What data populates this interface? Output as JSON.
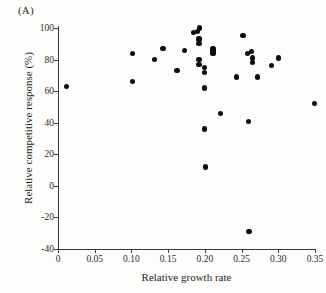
{
  "figure": {
    "panel_label": "(A)"
  },
  "chart_data": {
    "type": "scatter",
    "title": "(A)",
    "xlabel": "Relative growth rate",
    "ylabel": "Relative competitive response (%)",
    "xlim": [
      0,
      0.35
    ],
    "ylim": [
      -40,
      100
    ],
    "grid": false,
    "legend": null,
    "xticks": [
      "0",
      "0.05",
      "0.10",
      "0.15",
      "0.20",
      "0.25",
      "0.30",
      "0.35"
    ],
    "xtick_values": [
      0,
      0.05,
      0.1,
      0.15,
      0.2,
      0.25,
      0.3,
      0.35
    ],
    "yticks": [
      "100",
      "80",
      "60",
      "40",
      "20",
      "0",
      "-20",
      "-40"
    ],
    "ytick_values": [
      100,
      80,
      60,
      40,
      20,
      0,
      -20,
      -40
    ],
    "marker": "filled-circle",
    "marker_color": "#0c0c0c",
    "points": [
      {
        "x": 0.012,
        "y": 63
      },
      {
        "x": 0.101,
        "y": 84
      },
      {
        "x": 0.101,
        "y": 66
      },
      {
        "x": 0.131,
        "y": 80
      },
      {
        "x": 0.143,
        "y": 87
      },
      {
        "x": 0.162,
        "y": 73
      },
      {
        "x": 0.172,
        "y": 86
      },
      {
        "x": 0.184,
        "y": 97
      },
      {
        "x": 0.19,
        "y": 98
      },
      {
        "x": 0.193,
        "y": 100
      },
      {
        "x": 0.192,
        "y": 93
      },
      {
        "x": 0.192,
        "y": 90
      },
      {
        "x": 0.192,
        "y": 80
      },
      {
        "x": 0.192,
        "y": 77
      },
      {
        "x": 0.199,
        "y": 75
      },
      {
        "x": 0.2,
        "y": 72
      },
      {
        "x": 0.2,
        "y": 62
      },
      {
        "x": 0.2,
        "y": 36
      },
      {
        "x": 0.201,
        "y": 12
      },
      {
        "x": 0.211,
        "y": 87
      },
      {
        "x": 0.211,
        "y": 86
      },
      {
        "x": 0.211,
        "y": 85
      },
      {
        "x": 0.211,
        "y": 84
      },
      {
        "x": 0.221,
        "y": 46
      },
      {
        "x": 0.243,
        "y": 69
      },
      {
        "x": 0.252,
        "y": 95
      },
      {
        "x": 0.258,
        "y": 84
      },
      {
        "x": 0.263,
        "y": 85
      },
      {
        "x": 0.265,
        "y": 81
      },
      {
        "x": 0.265,
        "y": 78
      },
      {
        "x": 0.259,
        "y": 41
      },
      {
        "x": 0.26,
        "y": -29
      },
      {
        "x": 0.272,
        "y": 69
      },
      {
        "x": 0.291,
        "y": 76
      },
      {
        "x": 0.3,
        "y": 81
      },
      {
        "x": 0.349,
        "y": 52
      }
    ]
  }
}
